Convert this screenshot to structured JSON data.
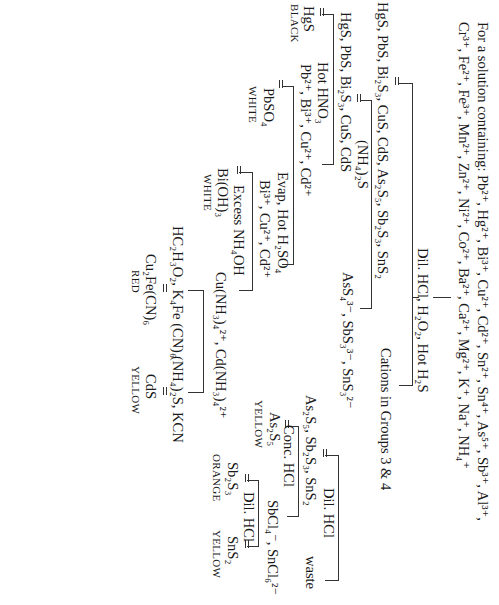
{
  "header": {
    "line1": "For a solution containing: Pb²⁺, Hg²⁺, Bi³⁺, Cu²⁺, Cd²⁺, Sn²⁺, Sn⁴⁺, As⁵⁺, Sb³⁺, Al³⁺,",
    "line2": "Cr³⁺, Fe²⁺, Fe³⁺, Mn²⁺, Zn²⁺, Ni²⁺, Co²⁺, Ba²⁺, Ca²⁺, Mg²⁺, K⁺, Na⁺, NH₄⁺"
  },
  "steps": {
    "step1_reagent": "Dil. HCl, H₂O₂, Hot H₂S",
    "step1_precipitate": "HgS, PbS, Bi₂S₃, CuS, CdS, As₂S₅, Sb₂S₃, SnS₂",
    "step1_solution": "Cations in Groups 3 & 4",
    "step2_reagent": "(NH₄)₂S",
    "step2_precipitate": "HgS, PbS, Bi₂S₃, CuS, CdS",
    "step2_solution": "AsS₄³⁻, SbS₃³⁻, SnS₃²⁻",
    "step3_reagent": "Hot HNO₃",
    "step3_precipitate": "HgS",
    "step3_precipitate_color": "BLACK",
    "step3_solution": "Pb²⁺, Bi³⁺, Cu²⁺, Cd²⁺",
    "step4_reagent": "Evap, Hot H₂SO₄",
    "step4_precipitate": "PbSO₄",
    "step4_precipitate_color": "WHITE",
    "step4_solution": "Bi³⁺, Cu²⁺, Cd²⁺",
    "step5_reagent": "Excess NH₄OH",
    "step5_precipitate": "Bi(OH)₃",
    "step5_precipitate_color": "WHITE",
    "step5_solution": "Cu(NH₃)₄²⁺, Cd(NH₃)₄²⁺",
    "step6_reagent_left": "HC₂H₃O₂, K₄Fe (CN)₆",
    "step6_reagent_right": "(NH₄)₂S, KCN",
    "step6_left_product": "Cu₂Fe(CN)₆",
    "step6_left_color": "RED",
    "step6_right_product": "CdS",
    "step6_right_color": "YELLOW",
    "step7_reagent": "Dil. HCl",
    "step7_precipitate": "As₂S₅, Sb₂S₃, SnS₂",
    "step7_solution": "waste",
    "step8_reagent": "Conc. HCl",
    "step8_precipitate": "As₂S₅",
    "step8_precipitate_color": "YELLOW",
    "step8_solution": "SbCl₄⁻, SnCl₆²⁻",
    "step9_reagent": "Dil. HCl",
    "step9_left_product": "Sb₂S₃",
    "step9_left_color": "ORANGE",
    "step9_right_product": "SnS₂",
    "step9_right_color": "YELLOW"
  }
}
